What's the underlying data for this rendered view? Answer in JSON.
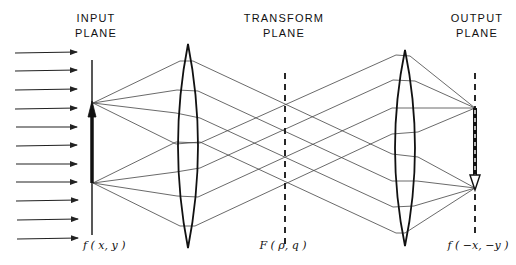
{
  "diagram": {
    "planes": [
      {
        "id": "input",
        "label_line1": "INPUT",
        "label_line2": "PLANE",
        "function": "f ( x, y )",
        "x": 92,
        "style": "solid"
      },
      {
        "id": "transform",
        "label_line1": "TRANSFORM",
        "label_line2": "PLANE",
        "function": "F ( ρ, q )",
        "x": 285,
        "style": "dashed"
      },
      {
        "id": "output",
        "label_line1": "OUTPUT",
        "label_line2": "PLANE",
        "function": "f ( −x, −y )",
        "x": 475,
        "style": "dashed"
      }
    ],
    "lenses": [
      {
        "id": "lens-1",
        "x": 188,
        "top": 44,
        "bottom": 248,
        "half_width": 14
      },
      {
        "id": "lens-2",
        "x": 405,
        "top": 50,
        "bottom": 246,
        "half_width": 14
      }
    ],
    "incoming_arrows": {
      "count": 11,
      "x_start": 15,
      "x_end": 77,
      "y_values": [
        53,
        71,
        90,
        108,
        127,
        145,
        164,
        182,
        201,
        219,
        238
      ]
    },
    "input_object": {
      "description": "upright arrow",
      "y_tail": 183,
      "y_head": 103
    },
    "output_image": {
      "description": "inverted arrow",
      "y_tail": 108,
      "y_head": 188
    },
    "colors": {
      "ink": "#111111",
      "ray": "#444444",
      "background": "#ffffff"
    }
  }
}
